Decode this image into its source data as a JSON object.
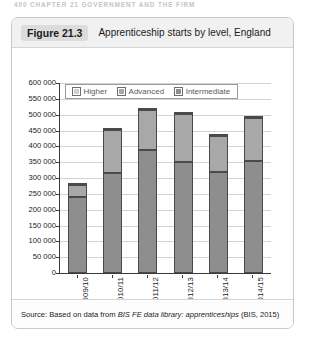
{
  "running_header": "400  CHAPTER 21  GOVERNMENT AND THE FIRM",
  "figure": {
    "number": "Figure 21.3",
    "title": "Apprenticeship starts by level, England"
  },
  "source": {
    "prefix": "Source: Based on data from ",
    "italic": "BIS FE data library: apprenticeships",
    "suffix": " (BIS, 2015)"
  },
  "colors": {
    "intermediate": "#8e8e8e",
    "advanced": "#a8a8a8",
    "higher": "#d0d0d0",
    "caption_bg": "#f1f1f1",
    "fig_number_bg": "#dcdcdc",
    "axis": "#3a3a3a",
    "grid": "#d2d2d2"
  },
  "chart_data": {
    "type": "bar",
    "title": "Apprenticeship starts by level, England",
    "xlabel": "",
    "ylabel": "",
    "stacked": true,
    "grid": true,
    "legend_position": "top-left-inside",
    "ylim": [
      0,
      600000
    ],
    "ytick_step": 50000,
    "ytick_labels": [
      "600 000",
      "550 000",
      "500 000",
      "450 000",
      "400 000",
      "350 000",
      "300 000",
      "250 000",
      "200 000",
      "150 000",
      "100 000",
      "50 000",
      "0"
    ],
    "ytick_values": [
      600000,
      550000,
      500000,
      450000,
      400000,
      350000,
      300000,
      250000,
      200000,
      150000,
      100000,
      50000,
      0
    ],
    "categories": [
      "2009/10",
      "2010/11",
      "2011/12",
      "2012/13",
      "2013/14",
      "2014/15"
    ],
    "series": [
      {
        "name": "Intermediate",
        "values": [
          240000,
          315000,
          390000,
          350000,
          320000,
          355000
        ]
      },
      {
        "name": "Advanced",
        "values": [
          38000,
          138000,
          125000,
          152000,
          113000,
          133000
        ]
      },
      {
        "name": "Higher",
        "values": [
          2000,
          4000,
          5000,
          8000,
          7000,
          7000
        ]
      }
    ],
    "totals": [
      280000,
      457000,
      520000,
      510000,
      440000,
      495000
    ]
  }
}
